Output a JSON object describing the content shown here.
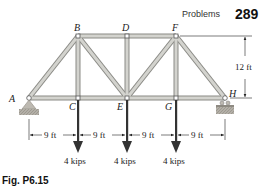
{
  "header": {
    "section": "Problems",
    "page_number": "289"
  },
  "figure": {
    "caption": "Fig. P6.15",
    "joints": [
      {
        "name": "A",
        "x": 29,
        "y": 98
      },
      {
        "name": "B",
        "x": 78,
        "y": 36
      },
      {
        "name": "C",
        "x": 78,
        "y": 98
      },
      {
        "name": "D",
        "x": 127,
        "y": 36
      },
      {
        "name": "E",
        "x": 127,
        "y": 98
      },
      {
        "name": "F",
        "x": 176,
        "y": 36
      },
      {
        "name": "G",
        "x": 176,
        "y": 98
      },
      {
        "name": "H",
        "x": 225,
        "y": 98
      }
    ],
    "labels": {
      "A": "A",
      "B": "B",
      "C": "C",
      "D": "D",
      "E": "E",
      "F": "F",
      "G": "G",
      "H": "H"
    },
    "members": [
      "AB",
      "AC",
      "BC",
      "BD",
      "BE",
      "CE",
      "DE",
      "DF",
      "EF",
      "EG",
      "FG",
      "FH",
      "GH"
    ],
    "loads": [
      {
        "joint": "C",
        "label": "4 kips"
      },
      {
        "joint": "E",
        "label": "4 kips"
      },
      {
        "joint": "G",
        "label": "4 kips"
      }
    ],
    "dimensions": {
      "horizontal": [
        "9 ft",
        "9 ft",
        "9 ft",
        "9 ft"
      ],
      "vertical": "12 ft"
    },
    "supports": {
      "A": "pin",
      "H": "roller"
    },
    "colors": {
      "member_fill": "#c9c9c4",
      "member_edge": "#8a8a85",
      "ground": "#b0aca4",
      "load_arrow": "#333333"
    }
  }
}
